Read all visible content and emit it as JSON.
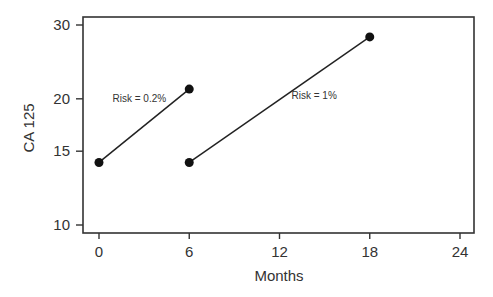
{
  "chart_data": {
    "type": "line",
    "title": "",
    "xlabel": "Months",
    "ylabel": "CA 125",
    "xlim": [
      0,
      24
    ],
    "ylim": [
      10,
      30
    ],
    "yscale": "log",
    "xticks": [
      0,
      6,
      12,
      18,
      24
    ],
    "xtick_labels": [
      "0",
      "6",
      "12",
      "18",
      "24"
    ],
    "yticks": [
      10,
      15,
      20,
      30
    ],
    "ytick_labels": [
      "10",
      "15",
      "20",
      "30"
    ],
    "grid": false,
    "legend": null,
    "series": [
      {
        "name": "Risk = 0.2%",
        "x": [
          0,
          6
        ],
        "y": [
          14.1,
          21.1
        ],
        "annotation": {
          "text": "Risk = 0.2%",
          "x": 0.9,
          "y": 19.6
        }
      },
      {
        "name": "Risk = 1%",
        "x": [
          6,
          18
        ],
        "y": [
          14.1,
          28.1
        ],
        "annotation": {
          "text": "Risk = 1%",
          "x": 12.8,
          "y": 20.0
        }
      }
    ]
  }
}
